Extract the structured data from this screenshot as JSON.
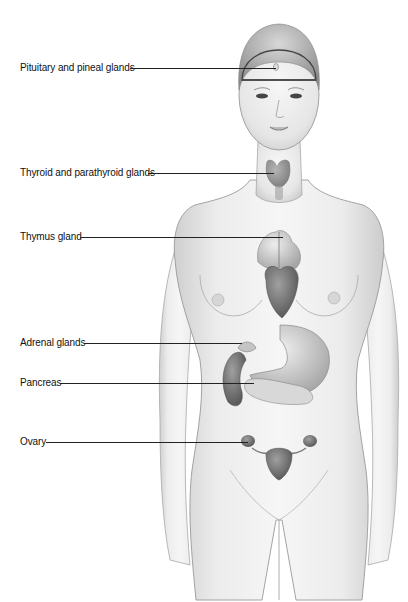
{
  "diagram": {
    "labels": [
      {
        "id": "pituitary",
        "text": "Pituitary and pineal glands",
        "x": 20,
        "y": 68,
        "line_x1": 130,
        "line_x2": 276
      },
      {
        "id": "thyroid",
        "text": "Thyroid and parathyroid glands",
        "x": 20,
        "y": 173,
        "line_x1": 148,
        "line_x2": 274
      },
      {
        "id": "thymus",
        "text": "Thymus gland",
        "x": 20,
        "y": 237,
        "line_x1": 80,
        "line_x2": 283
      },
      {
        "id": "adrenal",
        "text": "Adrenal glands",
        "x": 20,
        "y": 343,
        "line_x1": 84,
        "line_x2": 242
      },
      {
        "id": "pancreas",
        "text": "Pancreas",
        "x": 20,
        "y": 383,
        "line_x1": 60,
        "line_x2": 254
      },
      {
        "id": "ovary",
        "text": "Ovary",
        "x": 20,
        "y": 442,
        "line_x1": 46,
        "line_x2": 248
      }
    ],
    "colors": {
      "skin_light": "#f2f2f2",
      "skin_shade": "#cfcfcf",
      "outline": "#9a9a9a",
      "organ_dark": "#6e6e6e",
      "organ_mid": "#a8a8a8",
      "line": "#222222"
    }
  }
}
